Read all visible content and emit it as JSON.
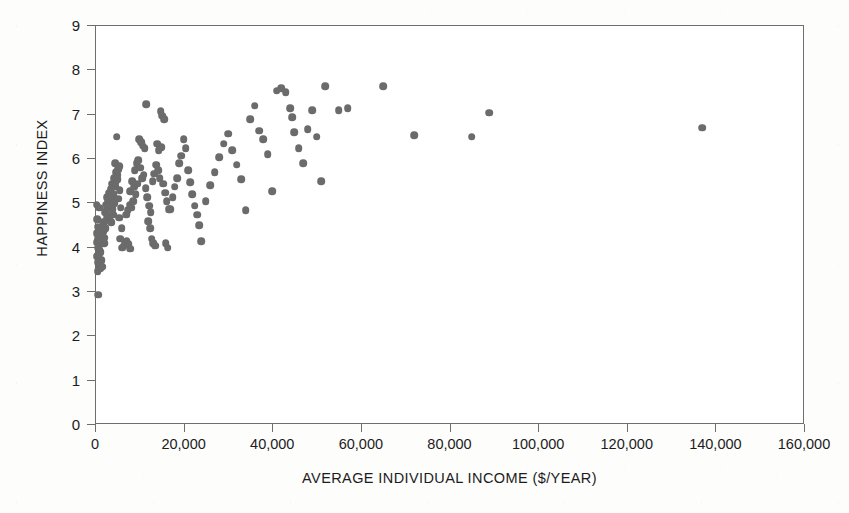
{
  "chart_data": {
    "type": "scatter",
    "title": "",
    "xlabel": "AVERAGE INDIVIDUAL INCOME ($/YEAR)",
    "ylabel": "HAPPINESS INDEX",
    "xlim": [
      0,
      160000
    ],
    "ylim": [
      0,
      9
    ],
    "xticks": [
      0,
      20000,
      40000,
      60000,
      80000,
      100000,
      120000,
      140000,
      160000
    ],
    "xtick_labels": [
      "0",
      "20,000",
      "40,000",
      "60,000",
      "80,000",
      "100,000",
      "120,000",
      "140,000",
      "160,000"
    ],
    "yticks": [
      0,
      1,
      2,
      3,
      4,
      5,
      6,
      7,
      8,
      9
    ],
    "ytick_labels": [
      "0",
      "1",
      "2",
      "3",
      "4",
      "5",
      "6",
      "7",
      "8",
      "9"
    ],
    "grid": false,
    "legend": null,
    "marker": "circle",
    "marker_color": "#6b6b6b",
    "marker_size_px": 7.6,
    "series": [
      {
        "name": "Countries",
        "points": [
          [
            700,
            2.92
          ],
          [
            400,
            4.95
          ],
          [
            900,
            4.88
          ],
          [
            500,
            4.62
          ],
          [
            600,
            4.45
          ],
          [
            800,
            4.38
          ],
          [
            400,
            4.3
          ],
          [
            1000,
            4.28
          ],
          [
            700,
            4.18
          ],
          [
            1200,
            4.22
          ],
          [
            500,
            4.1
          ],
          [
            900,
            4.05
          ],
          [
            1400,
            4.12
          ],
          [
            600,
            3.98
          ],
          [
            1100,
            3.92
          ],
          [
            800,
            3.85
          ],
          [
            1300,
            3.88
          ],
          [
            500,
            3.78
          ],
          [
            1000,
            3.72
          ],
          [
            700,
            3.65
          ],
          [
            1500,
            3.7
          ],
          [
            900,
            3.58
          ],
          [
            1200,
            3.52
          ],
          [
            600,
            3.45
          ],
          [
            1600,
            3.55
          ],
          [
            1800,
            4.35
          ],
          [
            2000,
            4.48
          ],
          [
            1700,
            4.25
          ],
          [
            2200,
            4.2
          ],
          [
            2400,
            4.42
          ],
          [
            2100,
            4.08
          ],
          [
            1900,
            4.55
          ],
          [
            2600,
            4.65
          ],
          [
            2300,
            4.78
          ],
          [
            2800,
            4.85
          ],
          [
            2500,
            4.95
          ],
          [
            3000,
            5.02
          ],
          [
            2700,
            5.12
          ],
          [
            3200,
            4.88
          ],
          [
            2900,
            4.7
          ],
          [
            3400,
            5.05
          ],
          [
            3100,
            5.22
          ],
          [
            3600,
            4.92
          ],
          [
            3300,
            4.6
          ],
          [
            3800,
            5.08
          ],
          [
            3500,
            5.3
          ],
          [
            4000,
            4.85
          ],
          [
            3700,
            4.55
          ],
          [
            4200,
            5.18
          ],
          [
            3900,
            5.42
          ],
          [
            4400,
            4.98
          ],
          [
            4100,
            4.72
          ],
          [
            4600,
            5.35
          ],
          [
            4300,
            5.55
          ],
          [
            4800,
            5.68
          ],
          [
            4500,
            5.88
          ],
          [
            5000,
            5.62
          ],
          [
            4700,
            5.45
          ],
          [
            5200,
            5.75
          ],
          [
            4900,
            6.48
          ],
          [
            5400,
            5.82
          ],
          [
            5100,
            5.52
          ],
          [
            5600,
            5.28
          ],
          [
            5300,
            5.08
          ],
          [
            5800,
            4.88
          ],
          [
            5500,
            4.65
          ],
          [
            6000,
            4.42
          ],
          [
            5700,
            4.18
          ],
          [
            6200,
            3.98
          ],
          [
            6500,
            4.02
          ],
          [
            6800,
            4.08
          ],
          [
            7200,
            4.12
          ],
          [
            7600,
            4.05
          ],
          [
            8000,
            3.95
          ],
          [
            7000,
            4.72
          ],
          [
            7400,
            4.82
          ],
          [
            7800,
            4.95
          ],
          [
            8200,
            4.88
          ],
          [
            8600,
            5.02
          ],
          [
            8000,
            5.25
          ],
          [
            8400,
            5.48
          ],
          [
            8800,
            5.35
          ],
          [
            9200,
            5.18
          ],
          [
            9600,
            5.42
          ],
          [
            9000,
            5.72
          ],
          [
            9400,
            5.88
          ],
          [
            9800,
            5.95
          ],
          [
            10200,
            5.78
          ],
          [
            10600,
            5.55
          ],
          [
            10000,
            6.42
          ],
          [
            10400,
            6.35
          ],
          [
            10800,
            6.28
          ],
          [
            11200,
            6.22
          ],
          [
            11600,
            7.22
          ],
          [
            11000,
            5.62
          ],
          [
            11400,
            5.32
          ],
          [
            11800,
            5.12
          ],
          [
            12200,
            4.92
          ],
          [
            12600,
            4.78
          ],
          [
            12000,
            4.58
          ],
          [
            12400,
            4.42
          ],
          [
            12800,
            4.18
          ],
          [
            13200,
            4.08
          ],
          [
            13600,
            4.02
          ],
          [
            13000,
            5.48
          ],
          [
            13400,
            5.65
          ],
          [
            13800,
            5.85
          ],
          [
            14200,
            5.72
          ],
          [
            14600,
            5.55
          ],
          [
            14000,
            6.32
          ],
          [
            14400,
            6.18
          ],
          [
            14800,
            7.05
          ],
          [
            15200,
            6.95
          ],
          [
            15600,
            6.88
          ],
          [
            15000,
            6.25
          ],
          [
            15400,
            5.42
          ],
          [
            15800,
            5.22
          ],
          [
            16200,
            5.02
          ],
          [
            16600,
            4.85
          ],
          [
            16000,
            4.08
          ],
          [
            16400,
            3.98
          ],
          [
            17000,
            4.85
          ],
          [
            17500,
            5.12
          ],
          [
            18000,
            5.35
          ],
          [
            18500,
            5.55
          ],
          [
            19000,
            5.88
          ],
          [
            19500,
            6.05
          ],
          [
            20000,
            6.42
          ],
          [
            20500,
            6.22
          ],
          [
            21000,
            5.72
          ],
          [
            21500,
            5.45
          ],
          [
            22000,
            5.18
          ],
          [
            22500,
            4.92
          ],
          [
            23000,
            4.72
          ],
          [
            23500,
            4.48
          ],
          [
            24000,
            4.12
          ],
          [
            25000,
            5.02
          ],
          [
            26000,
            5.38
          ],
          [
            27000,
            5.68
          ],
          [
            28000,
            6.02
          ],
          [
            29000,
            6.32
          ],
          [
            30000,
            6.55
          ],
          [
            31000,
            6.18
          ],
          [
            32000,
            5.85
          ],
          [
            33000,
            5.52
          ],
          [
            34000,
            4.82
          ],
          [
            35000,
            6.88
          ],
          [
            36000,
            7.18
          ],
          [
            37000,
            6.62
          ],
          [
            38000,
            6.42
          ],
          [
            39000,
            6.08
          ],
          [
            40000,
            5.25
          ],
          [
            41000,
            7.52
          ],
          [
            42000,
            7.58
          ],
          [
            43000,
            7.48
          ],
          [
            44000,
            7.12
          ],
          [
            44500,
            6.92
          ],
          [
            45000,
            6.58
          ],
          [
            46000,
            6.22
          ],
          [
            47000,
            5.88
          ],
          [
            48000,
            6.65
          ],
          [
            49000,
            7.08
          ],
          [
            50000,
            6.48
          ],
          [
            51000,
            5.48
          ],
          [
            52000,
            7.62
          ],
          [
            55000,
            7.08
          ],
          [
            57000,
            7.12
          ],
          [
            65000,
            7.62
          ],
          [
            72000,
            6.52
          ],
          [
            85000,
            6.48
          ],
          [
            89000,
            7.02
          ],
          [
            137000,
            6.68
          ]
        ]
      }
    ]
  },
  "axes": {
    "y_title": "HAPPINESS INDEX",
    "x_title": "AVERAGE INDIVIDUAL INCOME ($/YEAR)"
  }
}
